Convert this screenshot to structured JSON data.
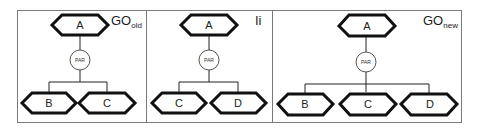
{
  "panels": [
    {
      "label": "GO",
      "label_sub": "old",
      "parent": "A",
      "operator": "PAR",
      "children": [
        "B",
        "C"
      ]
    },
    {
      "label": "Ii",
      "label_sub": "",
      "parent": "A",
      "operator": "PAR",
      "children": [
        "C",
        "D"
      ]
    },
    {
      "label": "GO",
      "label_sub": "new",
      "parent": "A",
      "operator": "PAR",
      "children": [
        "B",
        "C",
        "D"
      ]
    }
  ],
  "colors": {
    "frame": "#7a7a7a",
    "node_border": "#111111",
    "background": "#ffffff"
  }
}
